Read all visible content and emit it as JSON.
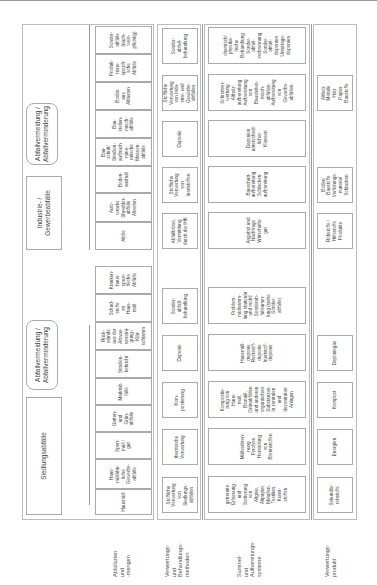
{
  "row_labels": [
    "Abfallarten\nund\n-mengen",
    "Verwertungs-\nund\nBehandlungs-\nmethoden",
    "Sammel-\nund\nAufbereitungs-\nsysteme",
    "Verwertungs-\nprodukt"
  ],
  "sources": {
    "siedlung": "Siedlungsabfälle",
    "industrie": "Industrie- /\nGewerbeabfälle",
    "vermeidung1": "Abfallvermeidung /\nAbfallverminderung",
    "vermeidung2": "Abfallvermeidung /\nAbfallverminderung"
  },
  "waste_types": [
    "Hausmüll",
    "Haus-\nmüllähn-\nliche\nGewerbe-\nabfälle",
    "Sperr-\nmüll /\ngut",
    "Garten-\nund\nGrün-\nabfälle",
    "Marktab-\nfälle",
    "Straßen-\nkehricht",
    "Rück-\nstände\naus der\nAbwas-\nserreini-\ngung /\nKlär-\nschlamm",
    "Schad-\nstoffe\nim\nHaus-\nmüll",
    "Kranken-\nhaus-\nspezi-\nfische\nAbfälle",
    "Altöle",
    "Auto-\nwracks\nShredder-\nabfälle\nAltreifen",
    "Boden-\naushub",
    "Bau-\nschutt/\nStraßen-\naufbruch\nmine-\nralische\nMassen-\nabfälle",
    "Bau-\nstellen-\nmisch-\nabfälle",
    "Boden\naus\nAltlasten",
    "Produk-\ntions-\nspezifi-\nsche\nAbfälle",
    "Sonder-\nabfälle\n(nach-\nweis-\npflichtig)"
  ],
  "methods": [
    "Stoffliche\nVerwertung\nvon\nSiedlungs-\nabfällen",
    "thermische\nVerwertung",
    "Kom-\npostierung",
    "Deponie",
    "Sonder-\nabfall-\nbehandlung",
    "Abfallbörse,\nVermittlung\ndurch die IHK",
    "Stoffliche\nVerwertung\nvon\nInertstoffen",
    "Deponie",
    "Stoffliche\nVerwertung\nvon Indu-\nstrie- und\nGewerbe-\nabfällen",
    "Sonder-\nabfall-\nbehandlung"
  ],
  "systems": [
    "getrennte\nErfassung\nund\nSortierung\nvon\nAltglas,\nAltpapier,\nMetallen,\nTextilien,\nKunst-\nstoffen",
    "Müllverbren-\nnung\nPyrolyse\nHerstellung\nvon\nBrennstoffen",
    "Kompostie-\nrung von\nHaus-\nmüll,\nBiomüll,\nGrünabfällen\nund anderen\norganischen\nSubstanzen\nin zentralen\nund\ndezentralen\nAnlagen",
    "Hausmüll-\ndeponie\nReststoff-\ndeponie\nInertstoff-\ndeponie",
    "Problem-\nmüllsamm-\nlung stationär\nund mobil\nSonderab-\nfallsamm-\nlung (siehe\nSonder-\nabfälle)",
    "Angebot und\nNachfrage\nWirtschafts-\ngut",
    "Bauschutt-\naufbereitung\nSchlacken-\naufbereitung",
    "Deponien\nunterschied-\nlicher\nKlassen",
    "Schrottver-\nwertung\nAltholz-\naufbereitung\nAufbereitung\nvon\nBaustellen-\nmisch-\nabfällen\nAufbereitung\nvon\nGewerbe-\nabfällen",
    "chemisch/\nphysika-\nlische\nBehandlung\nSonder-\nabfall-\nverbrennung\nSonder-\nabfall-\ndeponien\nUntertage-\ndeponien"
  ],
  "products": [
    "Sekundär-\nrohstoffe",
    "Energien",
    "Kompost",
    "Deponiegas",
    "Rohstoffe /\nHilfsstoffe\nProdukte",
    "Boden\nBaustoffe\nVerfüllungs-\nmaterial\nSchlacken",
    "Altholz\nMetalle\nHolz\nPapier\nBaustoffe"
  ]
}
